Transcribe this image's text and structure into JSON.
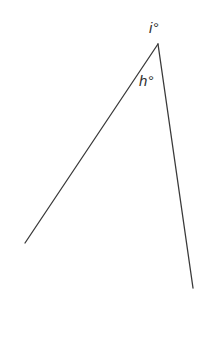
{
  "figure": {
    "background_color": "#ffffff",
    "stroke_color": "#3a3a3a",
    "stroke_width": 1.3,
    "width": 208,
    "height": 338,
    "vertices": {
      "apex": {
        "x": 158,
        "y": 44
      },
      "left_ray_end": {
        "x": 25,
        "y": 243
      },
      "right_ray_end": {
        "x": 193,
        "y": 288
      }
    },
    "segments": [
      {
        "name": "left-ray",
        "from": {
          "x": 158,
          "y": 44
        },
        "to": {
          "x": 25,
          "y": 243
        }
      },
      {
        "name": "right-ray",
        "from": {
          "x": 158,
          "y": 44
        },
        "to": {
          "x": 193,
          "y": 288
        }
      }
    ],
    "labels": {
      "exterior_angle": {
        "text": "i°",
        "variable": "i",
        "x": 149,
        "y": 20,
        "style": "italic",
        "font_size": 15,
        "color": "#333333"
      },
      "interior_angle": {
        "text": "h°",
        "variable": "h",
        "x": 139,
        "y": 73,
        "style": "italic",
        "font_size": 15,
        "color": "#333333"
      }
    }
  }
}
